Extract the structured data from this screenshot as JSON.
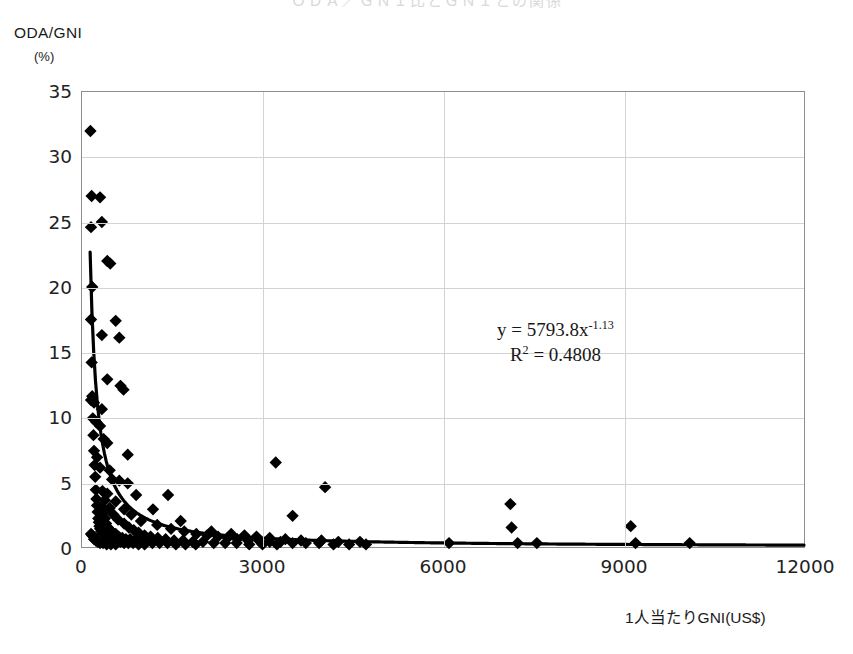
{
  "title": "ＯＤＡ／ＧＮＩ比とＧＮＩとの関係",
  "axes": {
    "y_label": "ODA/GNI",
    "y_unit": "(%)",
    "x_label": "1人当たりGNI(US$)",
    "y_ticks": [
      "0",
      "5",
      "10",
      "15",
      "20",
      "25",
      "30",
      "35"
    ],
    "x_ticks": [
      "0",
      "3000",
      "6000",
      "9000",
      "12000"
    ]
  },
  "annotation": {
    "equation_prefix": "y = 5793.8x",
    "equation_exponent": "-1.13",
    "r_squared_prefix": "R",
    "r_squared_sup": "2",
    "r_squared_value": " = 0.4808"
  },
  "style": {
    "marker_color": "#000000",
    "trendline_color": "#000000",
    "grid_color": "#d2d2d8",
    "frame_color": "#8c8c94"
  },
  "chart_data": {
    "type": "scatter",
    "title": "ＯＤＡ／ＧＮＩ比とＧＮＩとの関係",
    "xlabel": "1人当たりGNI(US$)",
    "ylabel": "ODA/GNI (%)",
    "xlim": [
      0,
      12000
    ],
    "ylim": [
      0,
      35
    ],
    "xticks": [
      0,
      3000,
      6000,
      9000,
      12000
    ],
    "yticks": [
      0,
      5,
      10,
      15,
      20,
      25,
      30,
      35
    ],
    "grid": true,
    "legend": "none",
    "marker": "filled-diamond",
    "annotations": [
      "y = 5793.8x^-1.13",
      "R^2 = 0.4808"
    ],
    "trendline": {
      "type": "power",
      "equation": "y = 5793.8 * x^-1.13",
      "coefficient": 5793.8,
      "exponent": -1.13,
      "r_squared": 0.4808
    },
    "points": [
      [
        140,
        32.0
      ],
      [
        160,
        27.0
      ],
      [
        300,
        26.9
      ],
      [
        330,
        25.0
      ],
      [
        150,
        24.6
      ],
      [
        420,
        22.0
      ],
      [
        470,
        21.8
      ],
      [
        170,
        20.0
      ],
      [
        150,
        17.5
      ],
      [
        560,
        17.4
      ],
      [
        330,
        16.3
      ],
      [
        620,
        16.1
      ],
      [
        160,
        14.2
      ],
      [
        420,
        12.9
      ],
      [
        640,
        12.4
      ],
      [
        690,
        12.1
      ],
      [
        170,
        11.6
      ],
      [
        150,
        11.3
      ],
      [
        200,
        11.1
      ],
      [
        330,
        10.6
      ],
      [
        180,
        9.9
      ],
      [
        240,
        9.6
      ],
      [
        300,
        9.3
      ],
      [
        190,
        8.6
      ],
      [
        360,
        8.3
      ],
      [
        420,
        8.0
      ],
      [
        200,
        7.4
      ],
      [
        760,
        7.1
      ],
      [
        250,
        6.9
      ],
      [
        3220,
        6.5
      ],
      [
        210,
        6.3
      ],
      [
        300,
        6.1
      ],
      [
        460,
        5.9
      ],
      [
        220,
        5.4
      ],
      [
        500,
        5.2
      ],
      [
        620,
        5.1
      ],
      [
        760,
        4.9
      ],
      [
        4040,
        4.6
      ],
      [
        230,
        4.4
      ],
      [
        340,
        4.3
      ],
      [
        420,
        4.1
      ],
      [
        900,
        4.0
      ],
      [
        1430,
        4.0
      ],
      [
        240,
        3.7
      ],
      [
        380,
        3.6
      ],
      [
        560,
        3.5
      ],
      [
        7120,
        3.3
      ],
      [
        250,
        3.2
      ],
      [
        330,
        3.1
      ],
      [
        460,
        3.0
      ],
      [
        700,
        2.9
      ],
      [
        1180,
        2.9
      ],
      [
        260,
        2.7
      ],
      [
        350,
        2.6
      ],
      [
        520,
        2.5
      ],
      [
        820,
        2.5
      ],
      [
        3500,
        2.4
      ],
      [
        270,
        2.2
      ],
      [
        380,
        2.2
      ],
      [
        600,
        2.1
      ],
      [
        980,
        2.0
      ],
      [
        1640,
        2.0
      ],
      [
        280,
        1.9
      ],
      [
        400,
        1.8
      ],
      [
        700,
        1.8
      ],
      [
        1250,
        1.7
      ],
      [
        9120,
        1.6
      ],
      [
        290,
        1.6
      ],
      [
        430,
        1.5
      ],
      [
        780,
        1.5
      ],
      [
        1480,
        1.4
      ],
      [
        7140,
        1.5
      ],
      [
        300,
        1.4
      ],
      [
        470,
        1.3
      ],
      [
        860,
        1.3
      ],
      [
        1700,
        1.2
      ],
      [
        2150,
        1.2
      ],
      [
        320,
        1.2
      ],
      [
        510,
        1.1
      ],
      [
        940,
        1.1
      ],
      [
        1900,
        1.0
      ],
      [
        2480,
        1.0
      ],
      [
        340,
        1.0
      ],
      [
        560,
        1.0
      ],
      [
        1040,
        0.9
      ],
      [
        2080,
        0.9
      ],
      [
        2700,
        0.9
      ],
      [
        360,
        0.9
      ],
      [
        610,
        0.8
      ],
      [
        1140,
        0.8
      ],
      [
        2260,
        0.8
      ],
      [
        2900,
        0.8
      ],
      [
        390,
        0.8
      ],
      [
        670,
        0.7
      ],
      [
        1260,
        0.7
      ],
      [
        2420,
        0.7
      ],
      [
        3120,
        0.7
      ],
      [
        420,
        0.7
      ],
      [
        730,
        0.6
      ],
      [
        1390,
        0.6
      ],
      [
        2580,
        0.6
      ],
      [
        3380,
        0.6
      ],
      [
        450,
        0.6
      ],
      [
        800,
        0.6
      ],
      [
        1530,
        0.5
      ],
      [
        2760,
        0.5
      ],
      [
        3640,
        0.5
      ],
      [
        490,
        0.5
      ],
      [
        880,
        0.5
      ],
      [
        1680,
        0.5
      ],
      [
        2940,
        0.5
      ],
      [
        3980,
        0.5
      ],
      [
        530,
        0.5
      ],
      [
        960,
        0.4
      ],
      [
        1840,
        0.4
      ],
      [
        3120,
        0.4
      ],
      [
        4260,
        0.4
      ],
      [
        580,
        0.4
      ],
      [
        1060,
        0.4
      ],
      [
        2010,
        0.4
      ],
      [
        3300,
        0.4
      ],
      [
        4620,
        0.4
      ],
      [
        640,
        0.4
      ],
      [
        1170,
        0.3
      ],
      [
        2190,
        0.3
      ],
      [
        3500,
        0.3
      ],
      [
        6100,
        0.3
      ],
      [
        700,
        0.3
      ],
      [
        1290,
        0.3
      ],
      [
        2380,
        0.3
      ],
      [
        3720,
        0.3
      ],
      [
        7240,
        0.3
      ],
      [
        770,
        0.3
      ],
      [
        1420,
        0.3
      ],
      [
        2570,
        0.3
      ],
      [
        3940,
        0.3
      ],
      [
        7560,
        0.3
      ],
      [
        850,
        0.3
      ],
      [
        1560,
        0.2
      ],
      [
        2780,
        0.2
      ],
      [
        4180,
        0.2
      ],
      [
        9200,
        0.3
      ],
      [
        940,
        0.2
      ],
      [
        1720,
        0.2
      ],
      [
        3000,
        0.2
      ],
      [
        4440,
        0.2
      ],
      [
        10100,
        0.3
      ],
      [
        1040,
        0.2
      ],
      [
        1890,
        0.2
      ],
      [
        3240,
        0.2
      ],
      [
        4720,
        0.2
      ],
      [
        200,
        0.6
      ],
      [
        230,
        0.5
      ],
      [
        260,
        0.4
      ],
      [
        300,
        0.3
      ],
      [
        350,
        0.3
      ],
      [
        410,
        0.2
      ],
      [
        480,
        0.2
      ],
      [
        560,
        0.2
      ],
      [
        150,
        1.0
      ],
      [
        170,
        0.9
      ],
      [
        190,
        0.8
      ]
    ]
  }
}
